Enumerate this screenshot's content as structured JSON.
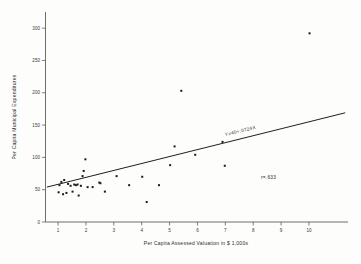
{
  "figure": {
    "background_color": "#fdfdfc",
    "ink_color": "#1a1a1a"
  },
  "chart_data": {
    "type": "scatter",
    "title": "",
    "xlabel": "Per Capita Assessed Valuation in $ 1,000s",
    "ylabel": "Per Capita Municipal Expenditures",
    "xlim": [
      0.55,
      11.4
    ],
    "ylim": [
      0,
      325
    ],
    "xticks": [
      1,
      2,
      3,
      4,
      5,
      6,
      7,
      8,
      9,
      10
    ],
    "xticklabels": [
      "1",
      "2",
      "3",
      "4",
      "5",
      "6",
      "7",
      "8",
      "9",
      "10"
    ],
    "yticks": [
      0,
      50,
      100,
      150,
      200,
      250,
      300
    ],
    "yticklabels": [
      "0",
      "50",
      "100",
      "150",
      "200",
      "250",
      "300"
    ],
    "grid": false,
    "legend": null,
    "points": [
      {
        "x": 1.02,
        "y": 46
      },
      {
        "x": 1.05,
        "y": 57
      },
      {
        "x": 1.12,
        "y": 62
      },
      {
        "x": 1.18,
        "y": 43
      },
      {
        "x": 1.22,
        "y": 65
      },
      {
        "x": 1.3,
        "y": 45
      },
      {
        "x": 1.36,
        "y": 59
      },
      {
        "x": 1.45,
        "y": 56
      },
      {
        "x": 1.52,
        "y": 47
      },
      {
        "x": 1.58,
        "y": 58
      },
      {
        "x": 1.64,
        "y": 57
      },
      {
        "x": 1.7,
        "y": 58
      },
      {
        "x": 1.74,
        "y": 41
      },
      {
        "x": 1.82,
        "y": 56
      },
      {
        "x": 1.88,
        "y": 71
      },
      {
        "x": 1.92,
        "y": 79
      },
      {
        "x": 1.98,
        "y": 97
      },
      {
        "x": 2.06,
        "y": 54
      },
      {
        "x": 2.24,
        "y": 54
      },
      {
        "x": 2.48,
        "y": 61
      },
      {
        "x": 2.52,
        "y": 60
      },
      {
        "x": 2.68,
        "y": 47
      },
      {
        "x": 3.1,
        "y": 71
      },
      {
        "x": 3.55,
        "y": 57
      },
      {
        "x": 4.02,
        "y": 70
      },
      {
        "x": 4.18,
        "y": 31
      },
      {
        "x": 4.62,
        "y": 57
      },
      {
        "x": 5.02,
        "y": 88
      },
      {
        "x": 5.18,
        "y": 117
      },
      {
        "x": 5.42,
        "y": 203
      },
      {
        "x": 5.92,
        "y": 104
      },
      {
        "x": 6.9,
        "y": 124
      },
      {
        "x": 6.98,
        "y": 87
      },
      {
        "x": 10.02,
        "y": 292
      }
    ],
    "fit_line": {
      "label": "Y=40+.0724X",
      "x_start": 0.6,
      "y_start": 54,
      "x_end": 11.3,
      "y_end": 169
    },
    "annotations": [
      {
        "name": "correlation",
        "text": "r=.633",
        "x": 8.55,
        "y": 66
      }
    ]
  }
}
